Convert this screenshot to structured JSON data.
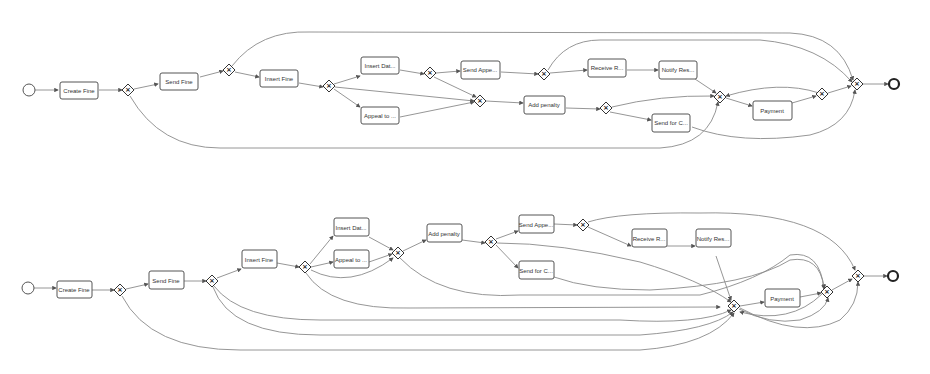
{
  "models": [
    {
      "id": "top",
      "tasks": [
        {
          "id": "t1",
          "label": "Create Fine",
          "x": 60,
          "y": 83
        },
        {
          "id": "t2",
          "label": "Send Fine",
          "x": 160,
          "y": 74
        },
        {
          "id": "t3",
          "label": "Insert Fine",
          "x": 260,
          "y": 70
        },
        {
          "id": "t4",
          "label": "Insert Dat...",
          "x": 361,
          "y": 57
        },
        {
          "id": "t5",
          "label": "Appeal to ...",
          "x": 361,
          "y": 107
        },
        {
          "id": "t6",
          "label": "Send Appe...",
          "x": 461,
          "y": 61
        },
        {
          "id": "t7",
          "label": "Add penalty",
          "x": 524,
          "y": 96
        },
        {
          "id": "t8",
          "label": "Receive R...",
          "x": 588,
          "y": 59
        },
        {
          "id": "t9",
          "label": "Notify Res...",
          "x": 659,
          "y": 61
        },
        {
          "id": "t10",
          "label": "Send for C...",
          "x": 652,
          "y": 114
        },
        {
          "id": "t11",
          "label": "Payment",
          "x": 753,
          "y": 101
        }
      ],
      "gateways": [
        {
          "id": "g1",
          "x": 128,
          "y": 90,
          "type": "xor"
        },
        {
          "id": "g2",
          "x": 229,
          "y": 70,
          "type": "xor"
        },
        {
          "id": "g3",
          "x": 329,
          "y": 86,
          "type": "xor"
        },
        {
          "id": "g4",
          "x": 430,
          "y": 73,
          "type": "xor"
        },
        {
          "id": "g5",
          "x": 480,
          "y": 101,
          "type": "xor"
        },
        {
          "id": "g6",
          "x": 544,
          "y": 74,
          "type": "xor"
        },
        {
          "id": "g7",
          "x": 606,
          "y": 108,
          "type": "xor"
        },
        {
          "id": "g8",
          "x": 720,
          "y": 97,
          "type": "xor"
        },
        {
          "id": "g9",
          "x": 822,
          "y": 94,
          "type": "xor"
        },
        {
          "id": "g10",
          "x": 857,
          "y": 84,
          "type": "xor"
        }
      ],
      "start": {
        "x": 29,
        "y": 90
      },
      "end": {
        "x": 894,
        "y": 84
      }
    },
    {
      "id": "bottom",
      "tasks": [
        {
          "id": "t1",
          "label": "Create Fine",
          "x": 57,
          "y": 289
        },
        {
          "id": "t2",
          "label": "Send Fine",
          "x": 149,
          "y": 282
        },
        {
          "id": "t3",
          "label": "Insert Fine",
          "x": 242,
          "y": 261
        },
        {
          "id": "t4",
          "label": "Insert Dat...",
          "x": 334,
          "y": 227
        },
        {
          "id": "t5",
          "label": "Appeal to ...",
          "x": 334,
          "y": 260
        },
        {
          "id": "t6",
          "label": "Add penalty",
          "x": 427,
          "y": 233
        },
        {
          "id": "t7",
          "label": "Send Appe...",
          "x": 519,
          "y": 223
        },
        {
          "id": "t8",
          "label": "Send for C...",
          "x": 519,
          "y": 269
        },
        {
          "id": "t9",
          "label": "Receive R...",
          "x": 632,
          "y": 238
        },
        {
          "id": "t10",
          "label": "Notify Res...",
          "x": 696,
          "y": 238
        },
        {
          "id": "t11",
          "label": "Payment",
          "x": 765,
          "y": 289
        }
      ],
      "gateways": [
        {
          "id": "g1",
          "x": 120,
          "y": 290,
          "type": "xor"
        },
        {
          "id": "g2",
          "x": 212,
          "y": 281,
          "type": "xor"
        },
        {
          "id": "g3",
          "x": 305,
          "y": 267,
          "type": "xor"
        },
        {
          "id": "g4",
          "x": 398,
          "y": 253,
          "type": "xor"
        },
        {
          "id": "g5",
          "x": 491,
          "y": 242,
          "type": "xor"
        },
        {
          "id": "g6",
          "x": 583,
          "y": 225,
          "type": "xor"
        },
        {
          "id": "g7",
          "x": 734,
          "y": 306,
          "type": "xor"
        },
        {
          "id": "g8",
          "x": 827,
          "y": 292,
          "type": "xor"
        },
        {
          "id": "g9",
          "x": 858,
          "y": 276,
          "type": "xor"
        }
      ],
      "start": {
        "x": 28,
        "y": 288
      },
      "end": {
        "x": 893,
        "y": 276
      }
    }
  ]
}
